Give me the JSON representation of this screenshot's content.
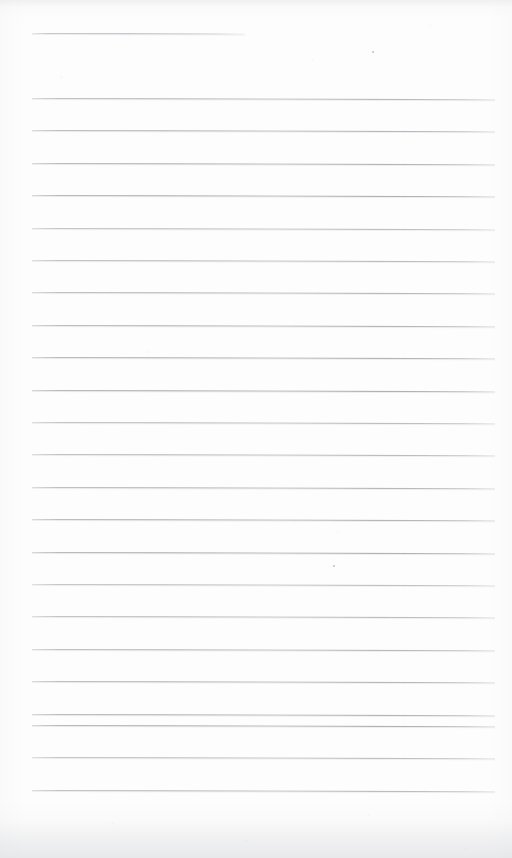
{
  "document": {
    "kind": "scanned-lined-paper",
    "title": "Blank ruled notepad page",
    "description": "A scanned blank sheet of ruled writing paper with no handwriting or printed text.",
    "page_width": 512,
    "page_height": 858,
    "background_color": "#fdfdfd",
    "rule_color": "#a7acb2",
    "content_text": ""
  },
  "ruling": {
    "left_margin_x": 32,
    "right_margin_x": 495,
    "line_spacing": 32.4,
    "line_thickness": 1,
    "tilt_degrees": 0.14,
    "total_lines": 24,
    "header_rule": {
      "index": 1,
      "y": 33,
      "x_start": 32,
      "x_end": 245,
      "label": "header-rule"
    },
    "body_lines": [
      {
        "index": 2,
        "y": 98.0,
        "x_start": 32,
        "x_end": 495
      },
      {
        "index": 3,
        "y": 130.4,
        "x_start": 32,
        "x_end": 495
      },
      {
        "index": 4,
        "y": 162.8,
        "x_start": 32,
        "x_end": 495
      },
      {
        "index": 5,
        "y": 195.2,
        "x_start": 32,
        "x_end": 495
      },
      {
        "index": 6,
        "y": 227.6,
        "x_start": 32,
        "x_end": 495
      },
      {
        "index": 7,
        "y": 260.0,
        "x_start": 32,
        "x_end": 495
      },
      {
        "index": 8,
        "y": 292.4,
        "x_start": 32,
        "x_end": 495
      },
      {
        "index": 9,
        "y": 324.8,
        "x_start": 32,
        "x_end": 495
      },
      {
        "index": 10,
        "y": 357.2,
        "x_start": 32,
        "x_end": 495
      },
      {
        "index": 11,
        "y": 389.6,
        "x_start": 32,
        "x_end": 495
      },
      {
        "index": 12,
        "y": 422.0,
        "x_start": 32,
        "x_end": 495
      },
      {
        "index": 13,
        "y": 454.4,
        "x_start": 32,
        "x_end": 495
      },
      {
        "index": 14,
        "y": 486.8,
        "x_start": 32,
        "x_end": 495
      },
      {
        "index": 15,
        "y": 519.2,
        "x_start": 32,
        "x_end": 495
      },
      {
        "index": 16,
        "y": 551.6,
        "x_start": 32,
        "x_end": 495
      },
      {
        "index": 17,
        "y": 584.0,
        "x_start": 32,
        "x_end": 495
      },
      {
        "index": 18,
        "y": 616.4,
        "x_start": 32,
        "x_end": 495
      },
      {
        "index": 19,
        "y": 648.8,
        "x_start": 32,
        "x_end": 495
      },
      {
        "index": 20,
        "y": 681.2,
        "x_start": 32,
        "x_end": 495
      },
      {
        "index": 21,
        "y": 713.6,
        "x_start": 32,
        "x_end": 495
      },
      {
        "index": 22,
        "y": 725.0,
        "x_start": 32,
        "x_end": 495
      },
      {
        "index": 23,
        "y": 757.4,
        "x_start": 32,
        "x_end": 495
      },
      {
        "index": 24,
        "y": 789.8,
        "x_start": 32,
        "x_end": 495
      }
    ]
  },
  "marks": [
    {
      "name": "scan-speck-upper",
      "x": 372,
      "y": 51,
      "size": 1.6
    },
    {
      "name": "scan-speck-middle",
      "x": 333,
      "y": 565,
      "size": 1.6
    }
  ]
}
